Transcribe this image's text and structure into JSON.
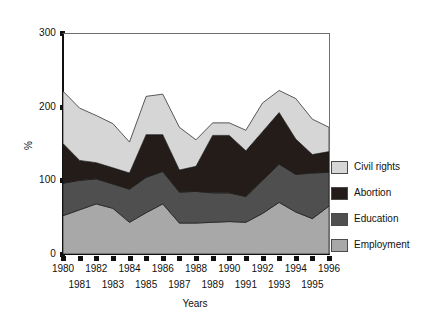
{
  "chart_data": {
    "type": "area",
    "stacked": true,
    "title": "",
    "xlabel": "Years",
    "ylabel": "%",
    "xlim": [
      1980,
      1996
    ],
    "ylim": [
      0,
      300
    ],
    "yticks": [
      0,
      100,
      200,
      300
    ],
    "grid": false,
    "legend_position": "right",
    "categories": [
      1980,
      1981,
      1982,
      1983,
      1984,
      1985,
      1986,
      1987,
      1988,
      1989,
      1990,
      1991,
      1992,
      1993,
      1994,
      1995,
      1996
    ],
    "x_tick_labels_top": [
      "1980",
      "1982",
      "1984",
      "1986",
      "1988",
      "1990",
      "1992",
      "1994",
      "1996"
    ],
    "x_tick_labels_bottom": [
      "1981",
      "1983",
      "1985",
      "1987",
      "1989",
      "1991",
      "1993",
      "1995"
    ],
    "series": [
      {
        "name": "Employment",
        "color": "#a8a8a8",
        "values": [
          52,
          60,
          68,
          62,
          43,
          56,
          68,
          42,
          42,
          43,
          44,
          43,
          55,
          70,
          57,
          48,
          65
        ]
      },
      {
        "name": "Education",
        "color": "#4f4f4f",
        "values": [
          44,
          40,
          34,
          33,
          45,
          48,
          44,
          42,
          43,
          40,
          39,
          35,
          45,
          52,
          51,
          62,
          46
        ]
      },
      {
        "name": "Abortion",
        "color": "#241c19",
        "values": [
          54,
          27,
          22,
          22,
          22,
          58,
          50,
          30,
          34,
          78,
          78,
          62,
          66,
          70,
          48,
          25,
          28
        ]
      },
      {
        "name": "Civil rights",
        "color": "#d6d6d6",
        "values": [
          71,
          71,
          64,
          60,
          42,
          52,
          55,
          58,
          36,
          17,
          17,
          28,
          39,
          30,
          55,
          48,
          33
        ]
      }
    ],
    "totals": [
      221,
      198,
      188,
      177,
      152,
      214,
      217,
      172,
      155,
      178,
      178,
      168,
      205,
      222,
      211,
      183,
      172
    ]
  },
  "legend": {
    "items": [
      {
        "label": "Civil rights",
        "color": "#d6d6d6"
      },
      {
        "label": "Abortion",
        "color": "#241c19"
      },
      {
        "label": "Education",
        "color": "#4f4f4f"
      },
      {
        "label": "Employment",
        "color": "#a8a8a8"
      }
    ]
  },
  "axes": {
    "y_title": "%",
    "x_title": "Years",
    "y_ticks": [
      "300",
      "200",
      "100",
      "0"
    ]
  }
}
